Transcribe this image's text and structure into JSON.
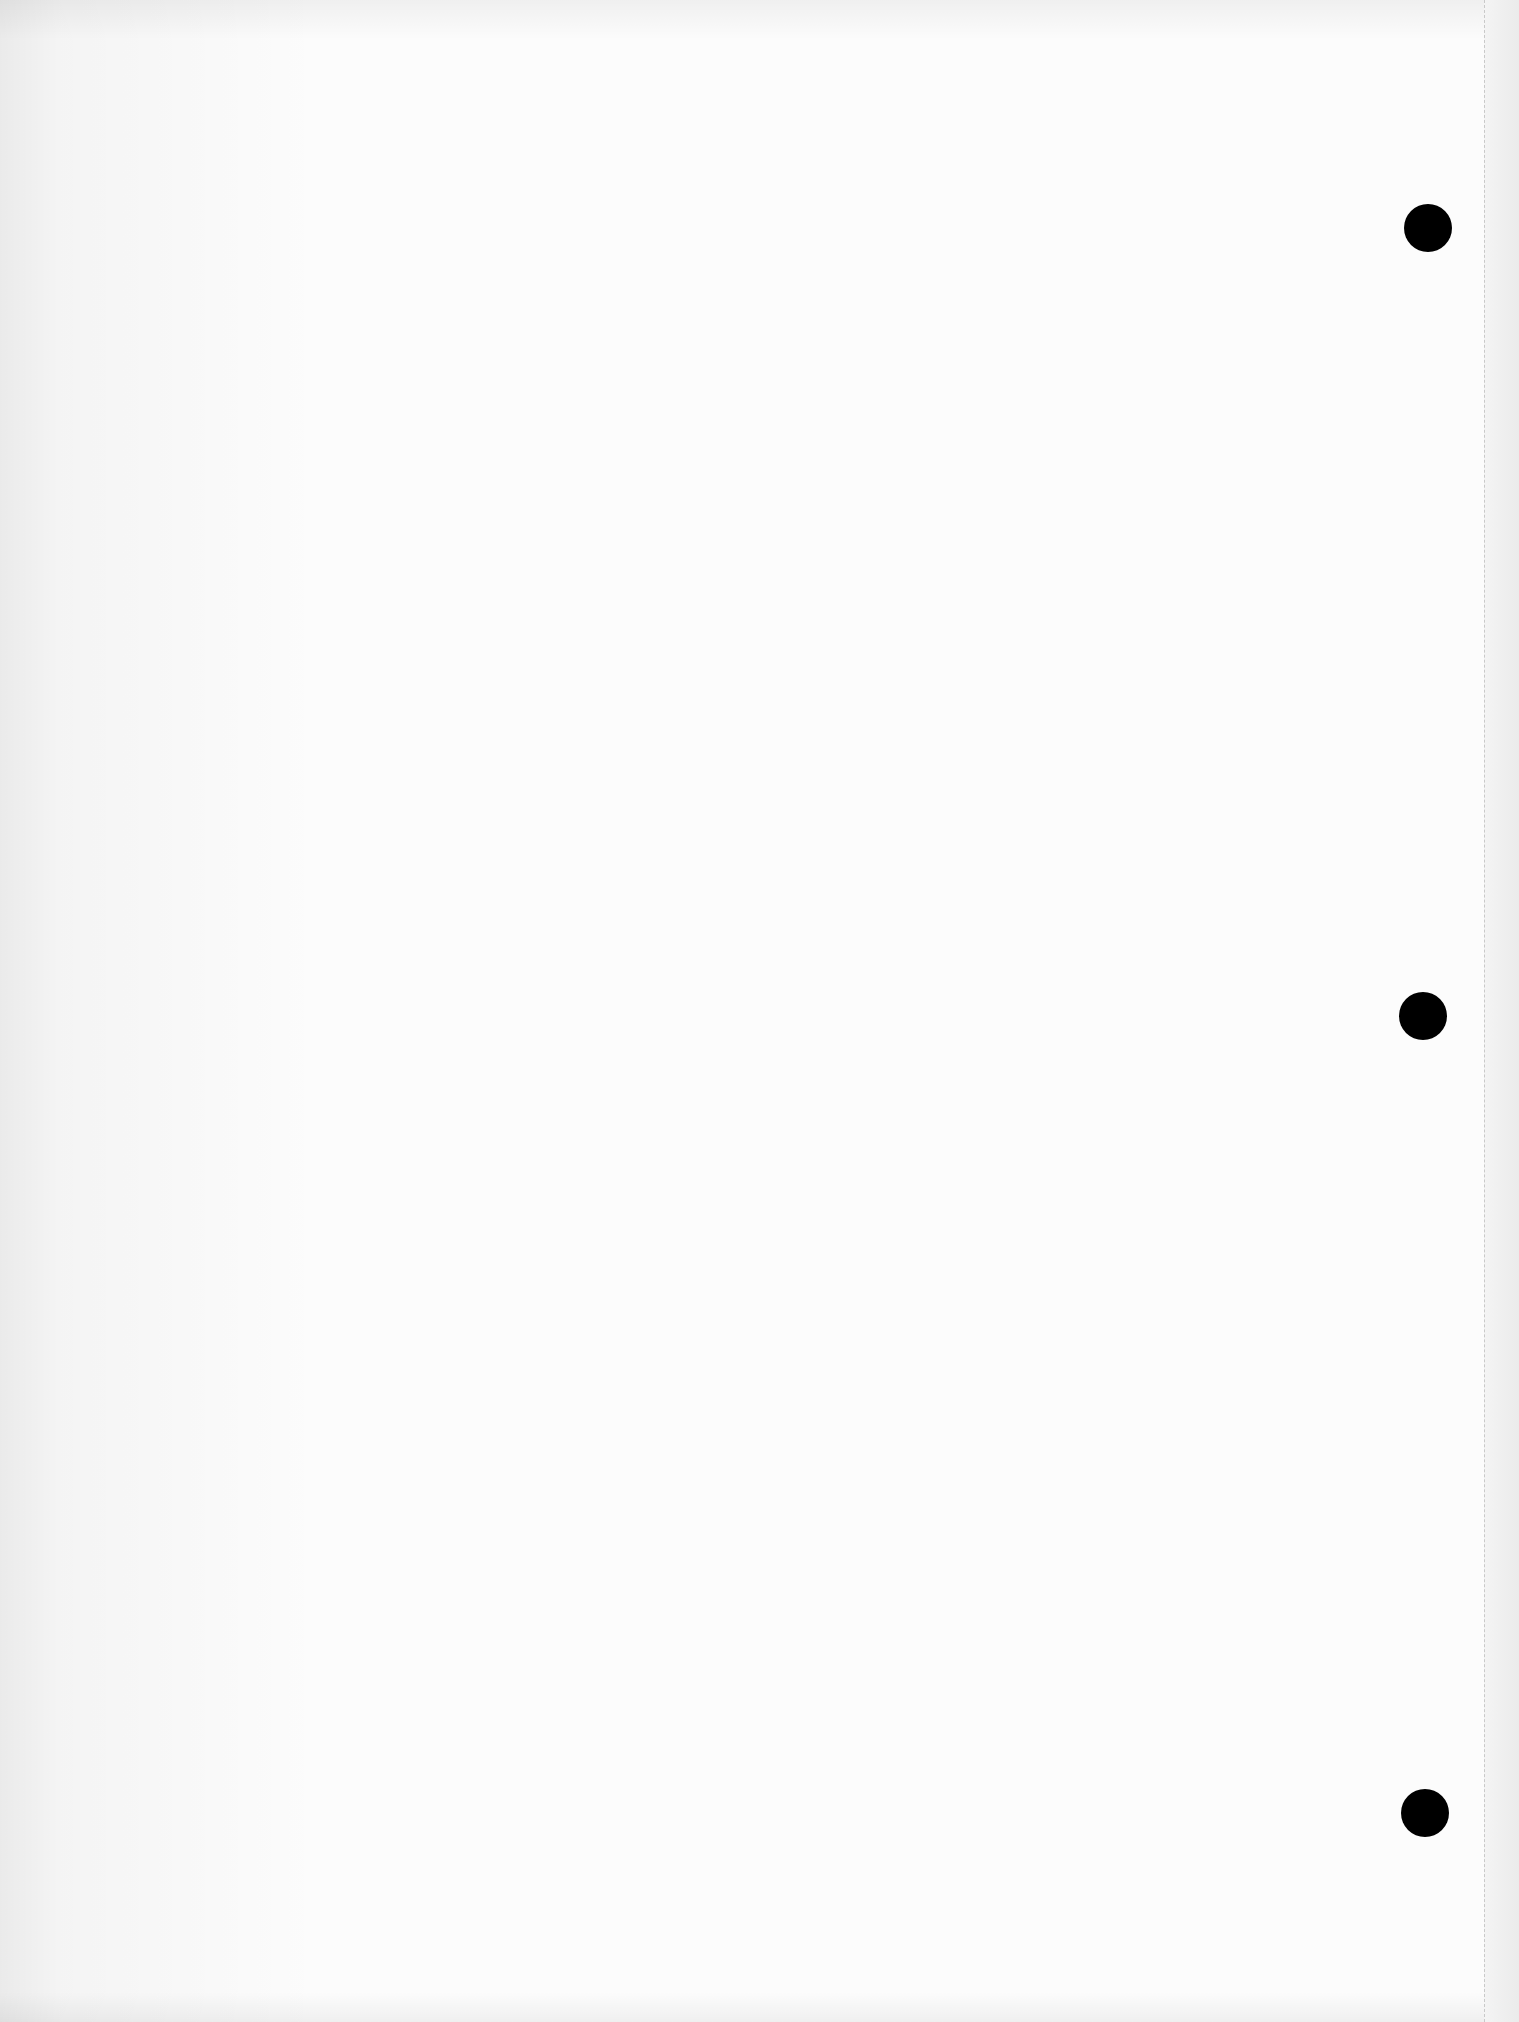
{
  "document": {
    "type": "blank-scanned-page",
    "content_text": "",
    "background_color": "#fbfbfb",
    "margin_strip_color": "#efefef",
    "perforation": {
      "x": 1484,
      "style": "dashed",
      "color": "#b8b8b8"
    },
    "punch_holes": [
      {
        "cx": 1428,
        "cy": 228,
        "r": 24,
        "color": "#000000"
      },
      {
        "cx": 1423,
        "cy": 1016,
        "r": 24,
        "color": "#000000"
      },
      {
        "cx": 1425,
        "cy": 1813,
        "r": 24,
        "color": "#000000"
      }
    ]
  }
}
